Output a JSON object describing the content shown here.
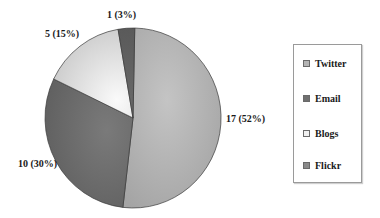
{
  "chart_data": {
    "type": "pie",
    "title": "",
    "categories": [
      "Twitter",
      "Email",
      "Blogs",
      "Flickr"
    ],
    "values": [
      17,
      10,
      5,
      1
    ],
    "percentages": [
      52,
      30,
      15,
      3
    ],
    "labels": [
      "17 (52%)",
      "10 (30%)",
      "5 (15%)",
      "1 (3%)"
    ],
    "colors": [
      "#b0b0b0",
      "#6e6e6e",
      "#ececec",
      "#5a5a5a"
    ],
    "start_angle_deg": 0,
    "direction": "clockwise",
    "legend_position": "right"
  },
  "legend": {
    "items": [
      {
        "label": "Twitter",
        "color": "#b4b4b4"
      },
      {
        "label": "Email",
        "color": "#707070"
      },
      {
        "label": "Blogs",
        "color": "#f0f0f0"
      },
      {
        "label": "Flickr",
        "color": "#8a8a8a"
      }
    ]
  }
}
